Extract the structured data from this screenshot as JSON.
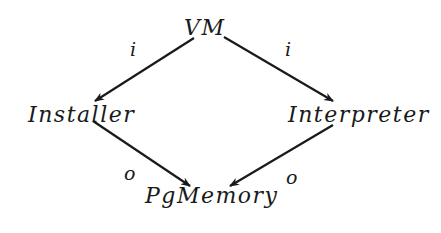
{
  "diagram": {
    "type": "directed-graph",
    "colors": {
      "background": "#ffffff",
      "stroke": "#1a1a1a",
      "text": "#1a1a1a"
    },
    "nodes": {
      "vm": {
        "label": "VM"
      },
      "installer": {
        "label": "Installer"
      },
      "interpreter": {
        "label": "Interpreter"
      },
      "pgmemory": {
        "label": "PgMemory"
      }
    },
    "edges": [
      {
        "from": "VM",
        "to": "Installer",
        "label": "i"
      },
      {
        "from": "VM",
        "to": "Interpreter",
        "label": "i"
      },
      {
        "from": "Installer",
        "to": "PgMemory",
        "label": "o"
      },
      {
        "from": "Interpreter",
        "to": "PgMemory",
        "label": "o"
      }
    ]
  }
}
